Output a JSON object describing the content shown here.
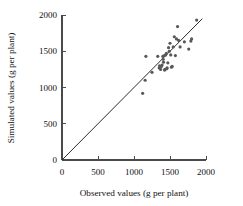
{
  "chart_data": {
    "type": "scatter",
    "title": "",
    "xlabel": "Observed values (g per plant)",
    "ylabel": "Simulated values (g per plant)",
    "xlim": [
      0,
      2000
    ],
    "ylim": [
      0,
      2000
    ],
    "xticks": [
      0,
      500,
      1000,
      1500,
      2000
    ],
    "yticks": [
      0,
      500,
      1000,
      1500,
      2000
    ],
    "xticklabels": [
      "0",
      "500",
      "1000",
      "1500",
      "2000"
    ],
    "yticklabels": [
      "0",
      "500",
      "1000",
      "1500",
      "2000"
    ],
    "grid": false,
    "legend": false,
    "marker": "filled-circle",
    "marker_color": "#585858",
    "reference_line": {
      "name": "1:1 line",
      "type": "linear",
      "slope": 1,
      "intercept": 0,
      "from": [
        0,
        0
      ],
      "to": [
        1950,
        1950
      ],
      "color": "#2b2b2b"
    },
    "x": [
      1120,
      1155,
      1165,
      1250,
      1330,
      1350,
      1355,
      1370,
      1380,
      1390,
      1400,
      1405,
      1410,
      1420,
      1425,
      1430,
      1440,
      1450,
      1455,
      1460,
      1470,
      1480,
      1490,
      1500,
      1510,
      1520,
      1530,
      1545,
      1560,
      1575,
      1590,
      1605,
      1620,
      1640,
      1700,
      1760,
      1790,
      1800,
      1870
    ],
    "y": [
      920,
      1100,
      1430,
      1210,
      1430,
      1270,
      1300,
      1250,
      1290,
      1310,
      1430,
      1390,
      1350,
      1440,
      1240,
      1250,
      1450,
      1470,
      1260,
      1270,
      1340,
      1550,
      1500,
      1610,
      1450,
      1280,
      1290,
      1560,
      1700,
      1440,
      1670,
      1840,
      1650,
      1560,
      1630,
      1530,
      1640,
      1670,
      1930
    ],
    "series": [
      {
        "name": "Simulated vs observed",
        "points": [
          [
            1120,
            920
          ],
          [
            1155,
            1100
          ],
          [
            1165,
            1430
          ],
          [
            1250,
            1210
          ],
          [
            1330,
            1430
          ],
          [
            1350,
            1270
          ],
          [
            1355,
            1300
          ],
          [
            1370,
            1250
          ],
          [
            1380,
            1290
          ],
          [
            1390,
            1310
          ],
          [
            1400,
            1430
          ],
          [
            1405,
            1390
          ],
          [
            1410,
            1350
          ],
          [
            1420,
            1440
          ],
          [
            1425,
            1240
          ],
          [
            1430,
            1250
          ],
          [
            1440,
            1450
          ],
          [
            1450,
            1470
          ],
          [
            1455,
            1260
          ],
          [
            1460,
            1270
          ],
          [
            1470,
            1340
          ],
          [
            1480,
            1550
          ],
          [
            1490,
            1500
          ],
          [
            1500,
            1610
          ],
          [
            1510,
            1450
          ],
          [
            1520,
            1280
          ],
          [
            1530,
            1290
          ],
          [
            1545,
            1560
          ],
          [
            1560,
            1700
          ],
          [
            1575,
            1440
          ],
          [
            1590,
            1670
          ],
          [
            1605,
            1840
          ],
          [
            1620,
            1650
          ],
          [
            1640,
            1560
          ],
          [
            1700,
            1630
          ],
          [
            1760,
            1530
          ],
          [
            1790,
            1640
          ],
          [
            1800,
            1670
          ],
          [
            1870,
            1930
          ]
        ]
      }
    ]
  },
  "layout": {
    "plot_left_px": 62,
    "plot_bottom_px": 160,
    "plot_right_px": 205,
    "plot_top_px": 15
  }
}
